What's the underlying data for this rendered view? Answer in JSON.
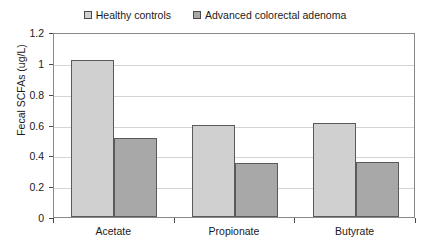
{
  "chart_data": {
    "type": "bar",
    "title": "",
    "subtitle": "",
    "xlabel": "",
    "ylabel": "Fecal SCFAs (ug/L)",
    "categories": [
      "Acetate",
      "Propionate",
      "Butyrate"
    ],
    "series": [
      {
        "name": "Healthy controls",
        "color": "#d0d0d0",
        "values": [
          1.02,
          0.595,
          0.61
        ]
      },
      {
        "name": "Advanced colorectal adenoma",
        "color": "#a8a8a8",
        "values": [
          0.51,
          0.35,
          0.355
        ]
      }
    ],
    "ylim": [
      0,
      1.2
    ],
    "y_ticks": [
      0,
      0.2,
      0.4,
      0.6,
      0.8,
      1,
      1.2
    ],
    "y_tick_labels": [
      "0",
      "0.2",
      "0.4",
      "0.6",
      "0.8",
      "1",
      "1.2"
    ],
    "grid": true,
    "grid_axis": "y",
    "legend_position": "top-center",
    "bar_edge_color": "#5a5a5a",
    "gridline_color": "#d4d4d4",
    "axis_color": "#8a8a8a",
    "background_color": "#ffffff"
  }
}
